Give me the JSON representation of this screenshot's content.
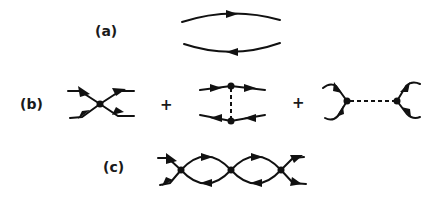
{
  "figure": {
    "panels": [
      {
        "id": "a",
        "label": "(a)",
        "description": "Two propagator lines with opposite arrows (particle-hole bubble)"
      },
      {
        "id": "b",
        "label": "(b)",
        "description": "Four-point vertex terms",
        "operators": [
          "+",
          "+"
        ]
      },
      {
        "id": "c",
        "label": "(c)",
        "description": "Chain of bubbles connecting three vertices"
      }
    ],
    "colors": {
      "ink": "#111111",
      "background": "#ffffff"
    }
  }
}
